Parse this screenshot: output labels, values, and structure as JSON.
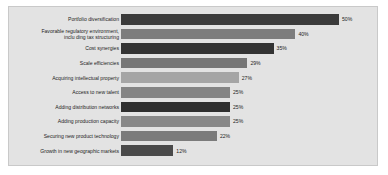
{
  "chart_data": {
    "type": "bar",
    "orientation": "horizontal",
    "title": "",
    "subtitle": "",
    "xlabel": "",
    "ylabel": "",
    "xlim": [
      0,
      50
    ],
    "grid": false,
    "legend": null,
    "value_suffix": "%",
    "categories": [
      "Portfolio diversification",
      "Favorable regulatory environment,\ninclu ding tax structuring",
      "Cost synergies",
      "Scale efficiencies",
      "Acquiring intellectual property",
      "Access to new talent",
      "Adding distribution networks",
      "Adding production capacity",
      "Securing new product technology",
      "Growth in new geographic markets"
    ],
    "values": [
      50,
      40,
      35,
      29,
      27,
      25,
      25,
      25,
      22,
      12
    ],
    "value_labels": [
      "50%",
      "40%",
      "35%",
      "29%",
      "27%",
      "25%",
      "25%",
      "25%",
      "22%",
      "12%"
    ],
    "bar_colors": [
      "#3b3b3b",
      "#7d7d7d",
      "#333333",
      "#767676",
      "#a5a5a5",
      "#848484",
      "#2e2e2e",
      "#888888",
      "#7b7b7b",
      "#4a4a4a"
    ],
    "plot_background": "#e3e3e3",
    "frame_border_color": "#c9c9c9",
    "page_background": "#ffffff"
  }
}
